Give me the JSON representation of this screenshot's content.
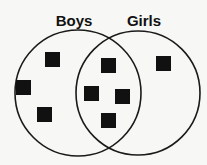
{
  "diagram": {
    "type": "venn",
    "sets": [
      {
        "id": "boys",
        "label": "Boys",
        "cx": 78,
        "cy": 93,
        "r": 63,
        "label_x": 74,
        "label_y": 26
      },
      {
        "id": "girls",
        "label": "Girls",
        "cx": 138,
        "cy": 93,
        "r": 62,
        "label_x": 144,
        "label_y": 26
      }
    ],
    "regions": {
      "boys_only": {
        "count": 3,
        "markers": [
          {
            "x": 45,
            "y": 52
          },
          {
            "x": 16,
            "y": 80
          },
          {
            "x": 37,
            "y": 107
          }
        ]
      },
      "both": {
        "count": 4,
        "markers": [
          {
            "x": 101,
            "y": 58
          },
          {
            "x": 84,
            "y": 86
          },
          {
            "x": 115,
            "y": 89
          },
          {
            "x": 101,
            "y": 113
          }
        ]
      },
      "girls_only": {
        "count": 1,
        "markers": [
          {
            "x": 156,
            "y": 56
          }
        ]
      }
    },
    "marker_size": 15,
    "colors": {
      "stroke": "#1a1a1a",
      "marker": "#111111",
      "background": "#f7f7f5"
    }
  }
}
